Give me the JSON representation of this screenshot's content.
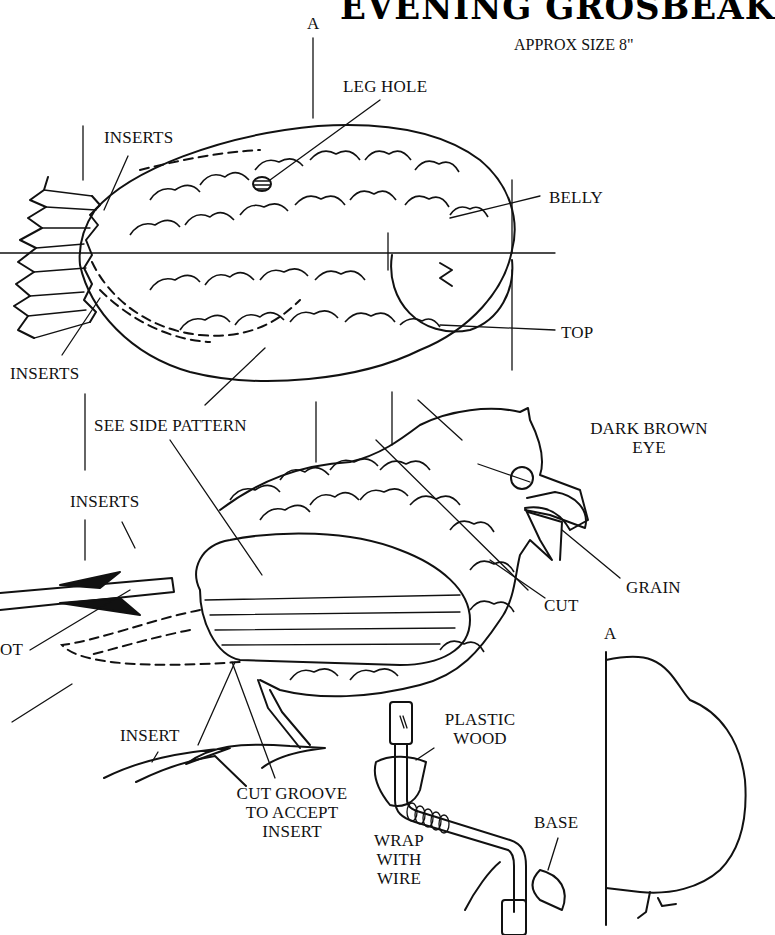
{
  "header": {
    "title": "EVENING GROSBEAK",
    "subtitle": "APPROX SIZE 8\""
  },
  "top_view": {
    "section_marker": "A",
    "labels": {
      "leg_hole": "LEG HOLE",
      "inserts_upper": "INSERTS",
      "belly": "BELLY",
      "inserts_lower": "INSERTS",
      "top": "TOP"
    }
  },
  "side_view": {
    "labels": {
      "see_side_pattern": "SEE SIDE PATTERN",
      "dark_brown_eye_line1": "DARK BROWN",
      "dark_brown_eye_line2": "EYE",
      "inserts": "INSERTS",
      "grain": "GRAIN",
      "cut": "CUT",
      "foot_partial": "OT"
    }
  },
  "insert_detail": {
    "labels": {
      "insert": "INSERT",
      "cut_groove_line1": "CUT GROOVE",
      "cut_groove_line2": "TO ACCEPT",
      "cut_groove_line3": "INSERT"
    }
  },
  "leg_detail": {
    "labels": {
      "plastic_line1": "PLASTIC",
      "plastic_line2": "WOOD",
      "wrap_line1": "WRAP",
      "wrap_line2": "WITH",
      "wrap_line3": "WIRE",
      "base": "BASE"
    }
  },
  "section_a": {
    "marker": "A"
  },
  "colors": {
    "ink": "#111111",
    "paper": "#ffffff"
  }
}
